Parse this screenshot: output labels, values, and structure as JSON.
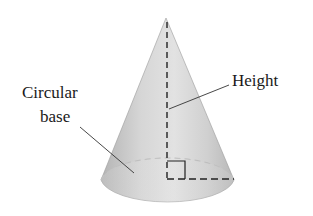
{
  "diagram": {
    "labels": {
      "height": "Height",
      "base_line1": "Circular",
      "base_line2": "base"
    },
    "colors": {
      "cone_light": "#f2f2f2",
      "cone_mid": "#cfcfcf",
      "cone_dark": "#a8a8a8",
      "line": "#222222",
      "background": "#ffffff"
    }
  }
}
